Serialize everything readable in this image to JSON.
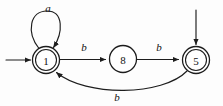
{
  "diagram": {
    "type": "finite-state-automaton",
    "colors": {
      "background": "#fdfdfd",
      "stroke": "#1d1d1d",
      "node_fill": "#ffffff",
      "text": "#101010"
    },
    "states": [
      {
        "id": "1",
        "label": "1",
        "accepting": true,
        "initial": true,
        "cx": 46,
        "cy": 60,
        "r": 13.5,
        "inner_r": 10.5
      },
      {
        "id": "8",
        "label": "8",
        "accepting": false,
        "initial": false,
        "cx": 123,
        "cy": 59,
        "r": 13.5,
        "inner_r": 10.5
      },
      {
        "id": "5",
        "label": "5",
        "accepting": true,
        "initial": true,
        "cx": 196,
        "cy": 60,
        "r": 13.5,
        "inner_r": 10.5
      }
    ],
    "transitions": [
      {
        "from": "1",
        "to": "1",
        "label": "a",
        "kind": "self-loop",
        "label_x": 48,
        "label_y": 8
      },
      {
        "from": "1",
        "to": "8",
        "label": "b",
        "kind": "straight",
        "label_x": 84,
        "label_y": 47
      },
      {
        "from": "8",
        "to": "5",
        "label": "b",
        "kind": "straight",
        "label_x": 159,
        "label_y": 47
      },
      {
        "from": "5",
        "to": "1",
        "label": "b",
        "kind": "curve-below",
        "label_x": 117,
        "label_y": 97
      }
    ],
    "start_arrows": [
      {
        "target": "1",
        "direction": "from-left"
      },
      {
        "target": "5",
        "direction": "from-above"
      }
    ]
  }
}
